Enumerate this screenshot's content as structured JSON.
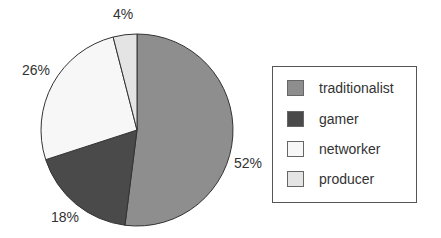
{
  "chart_data": {
    "type": "pie",
    "title": "",
    "categories": [
      "traditionalist",
      "gamer",
      "networker",
      "producer"
    ],
    "values": [
      52,
      18,
      26,
      4
    ],
    "labels": [
      "52%",
      "18%",
      "26%",
      "4%"
    ],
    "colors": [
      "#8e8e8e",
      "#4a4a4a",
      "#f7f7f7",
      "#e4e4e4"
    ],
    "start_angle_deg": 0,
    "direction": "clockwise-from-top",
    "legend_position": "right"
  },
  "legend": {
    "items": [
      {
        "label": "traditionalist",
        "color": "#8e8e8e"
      },
      {
        "label": "gamer",
        "color": "#4a4a4a"
      },
      {
        "label": "networker",
        "color": "#f7f7f7"
      },
      {
        "label": "producer",
        "color": "#e4e4e4"
      }
    ]
  },
  "slice_labels": {
    "traditionalist": "52%",
    "gamer": "18%",
    "networker": "26%",
    "producer": "4%"
  }
}
